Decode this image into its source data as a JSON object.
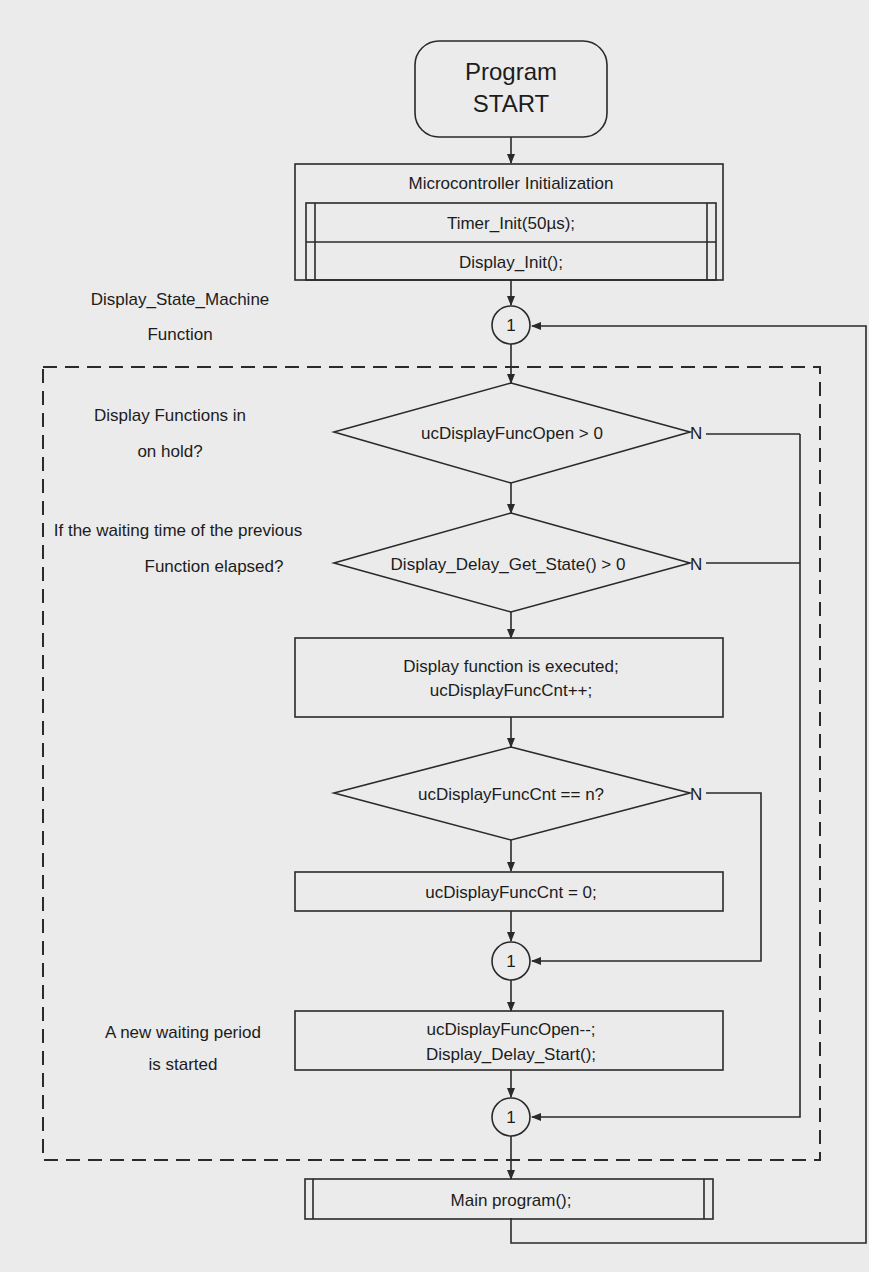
{
  "diagram": {
    "type": "flowchart",
    "start": {
      "line1": "Program",
      "line2": "START"
    },
    "init": {
      "title": "Microcontroller Initialization",
      "steps": [
        "Timer_Init(50µs);",
        "Display_Init();"
      ]
    },
    "annotations": {
      "state_machine_line1": "Display_State_Machine",
      "state_machine_line2": "Function",
      "hold_line1": "Display Functions in",
      "hold_line2": "on hold?",
      "waiting_line1": "If the waiting time of the previous",
      "waiting_line2": "Function elapsed?",
      "new_wait_line1": "A new waiting period",
      "new_wait_line2": "is started"
    },
    "connector_label": "1",
    "decisions": [
      {
        "text": "ucDisplayFuncOpen > 0",
        "no_label": "N"
      },
      {
        "text": "Display_Delay_Get_State() > 0",
        "no_label": "N"
      },
      {
        "text": "ucDisplayFuncCnt == n?",
        "no_label": "N"
      }
    ],
    "process_execute": {
      "line1": "Display function is executed;",
      "line2": "ucDisplayFuncCnt++;"
    },
    "process_reset": "ucDisplayFuncCnt = 0;",
    "process_start_wait": {
      "line1": "ucDisplayFuncOpen--;",
      "line2": "Display_Delay_Start();"
    },
    "main_program": "Main program();",
    "colors": {
      "background": "#ebebeb",
      "stroke": "#2a2a2a",
      "text": "#1c1c1c"
    }
  }
}
